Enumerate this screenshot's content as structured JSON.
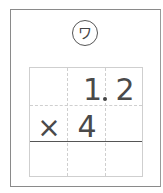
{
  "problem": {
    "label": "ワ",
    "rows": [
      [
        "",
        "1",
        "2"
      ],
      [
        "×",
        "4",
        ""
      ],
      [
        "",
        "",
        ""
      ]
    ],
    "decimal_after_column": 1
  }
}
